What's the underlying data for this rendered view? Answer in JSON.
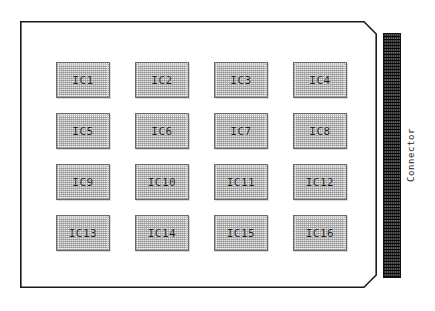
{
  "figure": {
    "background_color": "#ffffff"
  },
  "board": {
    "name": "printed-circuit-board",
    "outline_color": "#1a1a1a",
    "fill_color": "#ffffff",
    "shape": "rectangle-with-chamfered-right-corners"
  },
  "ic_grid": {
    "rows": 4,
    "columns": 4,
    "fill_color": "#e9e9e9",
    "border_color": "#6a6a6a",
    "text_color": "#1c1c1c",
    "chips": [
      {
        "label": "IC1",
        "row": 1,
        "col": 1
      },
      {
        "label": "IC2",
        "row": 1,
        "col": 2
      },
      {
        "label": "IC3",
        "row": 1,
        "col": 3
      },
      {
        "label": "IC4",
        "row": 1,
        "col": 4
      },
      {
        "label": "IC5",
        "row": 2,
        "col": 1
      },
      {
        "label": "IC6",
        "row": 2,
        "col": 2
      },
      {
        "label": "IC7",
        "row": 2,
        "col": 3
      },
      {
        "label": "IC8",
        "row": 2,
        "col": 4
      },
      {
        "label": "IC9",
        "row": 3,
        "col": 1
      },
      {
        "label": "IC10",
        "row": 3,
        "col": 2
      },
      {
        "label": "IC11",
        "row": 3,
        "col": 3
      },
      {
        "label": "IC12",
        "row": 3,
        "col": 4
      },
      {
        "label": "IC13",
        "row": 4,
        "col": 1
      },
      {
        "label": "IC14",
        "row": 4,
        "col": 2
      },
      {
        "label": "IC15",
        "row": 4,
        "col": 3
      },
      {
        "label": "IC16",
        "row": 4,
        "col": 4
      }
    ]
  },
  "connector": {
    "label": "Connector",
    "fill_color": "#3b3b3b",
    "border_color": "#111111",
    "text_color": "#222222",
    "orientation": "vertical"
  }
}
